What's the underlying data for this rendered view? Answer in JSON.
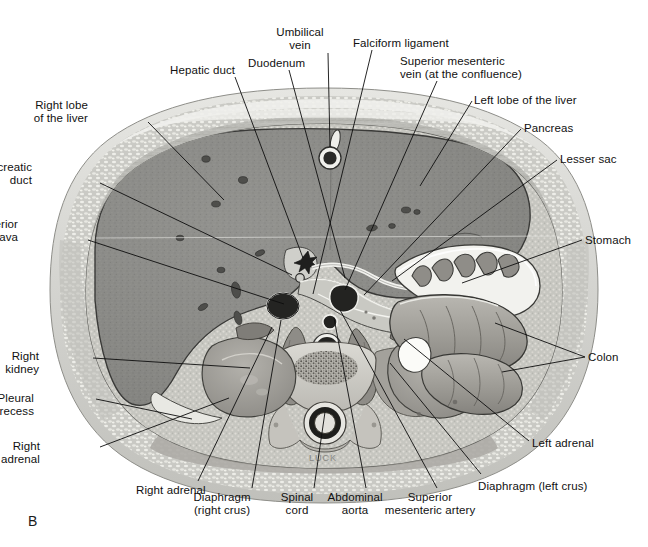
{
  "figure": {
    "plate_letter": "B",
    "modality": "anatomical-cross-section-illustration",
    "artist_signature": "LUCK",
    "background_color": "#ffffff",
    "ink_color": "#0d0d0d"
  },
  "labels": [
    {
      "id": "hepatic-duct",
      "text": "Hepatic duct",
      "align": "left",
      "x": 170,
      "y": 64,
      "line": [
        [
          235,
          77
        ],
        [
          303,
          258
        ]
      ]
    },
    {
      "id": "duodenum",
      "text": "Duodenum",
      "align": "left",
      "x": 248,
      "y": 57,
      "line": [
        [
          289,
          70
        ],
        [
          345,
          278
        ]
      ]
    },
    {
      "id": "umbilical-vein",
      "text": "Umbilical\nvein",
      "align": "center",
      "x": 300,
      "y": 26,
      "line": [
        [
          328,
          53
        ],
        [
          330,
          147
        ]
      ]
    },
    {
      "id": "falciform-ligament",
      "text": "Falciform ligament",
      "align": "left",
      "x": 353,
      "y": 37,
      "line": [
        [
          372,
          50
        ],
        [
          313,
          294
        ]
      ]
    },
    {
      "id": "superior-mesenteric-vein",
      "text": "Superior mesenteric\nvein (at the confluence)",
      "align": "left",
      "x": 400,
      "y": 55,
      "line": [
        [
          437,
          81
        ],
        [
          345,
          290
        ]
      ]
    },
    {
      "id": "left-lobe-of-liver",
      "text": "Left lobe of the liver",
      "align": "left",
      "x": 474,
      "y": 94,
      "line": [
        [
          472,
          101
        ],
        [
          420,
          186
        ]
      ]
    },
    {
      "id": "pancreas",
      "text": "Pancreas",
      "align": "left",
      "x": 524,
      "y": 122,
      "line": [
        [
          521,
          129
        ],
        [
          364,
          295
        ]
      ]
    },
    {
      "id": "lesser-sac",
      "text": "Lesser sac",
      "align": "left",
      "x": 560,
      "y": 153,
      "line": [
        [
          557,
          160
        ],
        [
          392,
          281
        ]
      ]
    },
    {
      "id": "stomach",
      "text": "Stomach",
      "align": "left",
      "x": 585,
      "y": 234,
      "line": [
        [
          582,
          240
        ],
        [
          462,
          283
        ]
      ]
    },
    {
      "id": "colon-upper",
      "text": "Colon",
      "align": "left",
      "x": 588,
      "y": 351,
      "line": [
        [
          585,
          357
        ],
        [
          495,
          323
        ]
      ]
    },
    {
      "id": "colon-lower",
      "text": "",
      "align": "left",
      "x": 588,
      "y": 351,
      "line": [
        [
          585,
          357
        ],
        [
          502,
          372
        ]
      ]
    },
    {
      "id": "left-adrenal",
      "text": "Left adrenal",
      "align": "left",
      "x": 532,
      "y": 437,
      "line": [
        [
          529,
          441
        ],
        [
          404,
          339
        ]
      ]
    },
    {
      "id": "diaphragm-left-crus",
      "text": "Diaphragm (left crus)",
      "align": "left",
      "x": 478,
      "y": 480,
      "line": [
        [
          481,
          474
        ],
        [
          390,
          363
        ]
      ]
    },
    {
      "id": "superior-mesenteric-artery",
      "text": "Superior\nmesenteric artery",
      "align": "center",
      "x": 430,
      "y": 491,
      "line": [
        [
          437,
          488
        ],
        [
          340,
          310
        ]
      ]
    },
    {
      "id": "abdominal-aorta",
      "text": "Abdominal\naorta",
      "align": "center",
      "x": 355,
      "y": 491,
      "line": [
        [
          366,
          488
        ],
        [
          334,
          318
        ]
      ]
    },
    {
      "id": "spinal-cord",
      "text": "Spinal\ncord",
      "align": "center",
      "x": 297,
      "y": 491,
      "line": [
        [
          314,
          488
        ],
        [
          325,
          412
        ]
      ]
    },
    {
      "id": "diaphragm-right-crus",
      "text": "Diaphragm\n(right crus)",
      "align": "center",
      "x": 222,
      "y": 491,
      "line": [
        [
          252,
          488
        ],
        [
          281,
          320
        ]
      ]
    },
    {
      "id": "right-adrenal-lower",
      "text": "Right adrenal",
      "align": "left",
      "x": 136,
      "y": 484,
      "line": [
        [
          198,
          481
        ],
        [
          272,
          327
        ]
      ]
    },
    {
      "id": "right-adrenal",
      "text": "Right\nadrenal",
      "align": "right",
      "x": 40,
      "y": 440,
      "line": [
        [
          100,
          447
        ],
        [
          229,
          398
        ]
      ]
    },
    {
      "id": "pleural-recess",
      "text": "Pleural\nrecess",
      "align": "right",
      "x": 34,
      "y": 392,
      "line": [
        [
          96,
          399
        ],
        [
          192,
          419
        ]
      ]
    },
    {
      "id": "right-kidney",
      "text": "Right\nkidney",
      "align": "right",
      "x": 39,
      "y": 350,
      "line": [
        [
          93,
          358
        ],
        [
          250,
          368
        ]
      ]
    },
    {
      "id": "inferior-vena-cava",
      "text": "Inferior\nvena cava",
      "align": "right",
      "x": 18,
      "y": 218,
      "line": [
        [
          88,
          240
        ],
        [
          284,
          304
        ]
      ]
    },
    {
      "id": "pancreatic-duct",
      "text": "Pancreatic\nduct",
      "align": "right",
      "x": 32,
      "y": 161,
      "line": [
        [
          100,
          183
        ],
        [
          292,
          275
        ]
      ]
    },
    {
      "id": "right-lobe-of-liver",
      "text": "Right lobe\nof the liver",
      "align": "right",
      "x": 88,
      "y": 99,
      "line": [
        [
          148,
          122
        ],
        [
          224,
          200
        ]
      ]
    }
  ],
  "anatomy_regions": [
    {
      "id": "skin-subcutaneous-fat",
      "name": "Skin and subcutaneous fat",
      "tone": "#d7d7d4"
    },
    {
      "id": "abdominal-wall-muscle",
      "name": "Abdominal wall musculature",
      "tone": "#b9b9b4"
    },
    {
      "id": "liver-right-lobe",
      "name": "Right lobe of the liver",
      "tone": "#8b8b88"
    },
    {
      "id": "liver-left-lobe",
      "name": "Left lobe of the liver",
      "tone": "#8b8b88"
    },
    {
      "id": "stomach",
      "name": "Stomach",
      "tone": "#a8a8a4"
    },
    {
      "id": "colon",
      "name": "Colon",
      "tone": "#9e9e9a"
    },
    {
      "id": "pancreas",
      "name": "Pancreas",
      "tone": "#c3c3bd"
    },
    {
      "id": "right-kidney",
      "name": "Right kidney",
      "tone": "#a2a29d"
    },
    {
      "id": "left-kidney",
      "name": "Left kidney",
      "tone": "#a2a29d"
    },
    {
      "id": "vertebral-body",
      "name": "Vertebral body",
      "tone": "#cfcfc9"
    },
    {
      "id": "spinal-cord",
      "name": "Spinal cord",
      "tone": "#d9d9d3"
    },
    {
      "id": "abdominal-aorta",
      "name": "Abdominal aorta",
      "tone": "#2b2b2b"
    },
    {
      "id": "inferior-vena-cava",
      "name": "Inferior vena cava",
      "tone": "#2b2b2b"
    },
    {
      "id": "superior-mesenteric-artery",
      "name": "Superior mesenteric artery",
      "tone": "#2b2b2b"
    },
    {
      "id": "superior-mesenteric-vein",
      "name": "Superior mesenteric vein",
      "tone": "#2b2b2b"
    },
    {
      "id": "umbilical-vein",
      "name": "Umbilical vein",
      "tone": "#2b2b2b"
    }
  ]
}
